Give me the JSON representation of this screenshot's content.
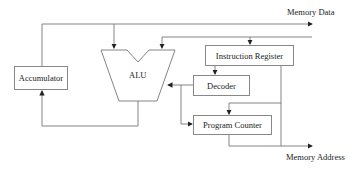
{
  "diagram": {
    "type": "cpu-block-diagram",
    "labels": {
      "memory_data": "Memory Data",
      "memory_address": "Memory Address"
    },
    "blocks": {
      "accumulator": "Accumulator",
      "alu": "ALU",
      "instruction_register": "Instruction Register",
      "decoder": "Decoder",
      "program_counter": "Program Counter"
    },
    "colors": {
      "line": "#777777",
      "text": "#222222"
    }
  }
}
